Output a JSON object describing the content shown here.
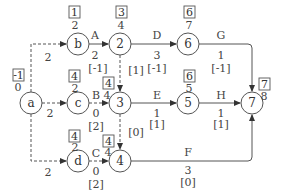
{
  "diagram": {
    "type": "activity-on-arrow network",
    "nodes": [
      {
        "id": "a",
        "label": "a",
        "box": "-1",
        "value": "0"
      },
      {
        "id": "b",
        "label": "b",
        "box": "1",
        "value": "2"
      },
      {
        "id": "c",
        "label": "c",
        "box": "4",
        "value": "2"
      },
      {
        "id": "d",
        "label": "d",
        "box": "4",
        "value": "2"
      },
      {
        "id": "n2",
        "label": "2",
        "box": "3",
        "value": "4"
      },
      {
        "id": "n3",
        "label": "3",
        "box": "4",
        "value": "4"
      },
      {
        "id": "n4",
        "label": "4",
        "box": "4",
        "value": "4"
      },
      {
        "id": "n5",
        "label": "5",
        "box": "6",
        "value": "5"
      },
      {
        "id": "n6",
        "label": "6",
        "box": "6",
        "value": "7"
      },
      {
        "id": "n7",
        "label": "7",
        "box": "7",
        "value": "8"
      }
    ],
    "edges": [
      {
        "from": "a",
        "to": "b",
        "style": "dashed",
        "duration": "2"
      },
      {
        "from": "a",
        "to": "c",
        "style": "dashed",
        "duration": "2"
      },
      {
        "from": "a",
        "to": "d",
        "style": "dashed",
        "duration": "2"
      },
      {
        "from": "b",
        "to": "n2",
        "style": "solid",
        "name": "A",
        "duration": "2",
        "float": "[-1]"
      },
      {
        "from": "c",
        "to": "n3",
        "style": "dashed",
        "name": "B",
        "duration": "0",
        "float": "[2]"
      },
      {
        "from": "d",
        "to": "n4",
        "style": "dashed",
        "name": "C",
        "duration": "0",
        "float": "[2]"
      },
      {
        "from": "n2",
        "to": "n6",
        "style": "solid",
        "name": "D",
        "duration": "3",
        "float": "[-1]"
      },
      {
        "from": "n2",
        "to": "n3",
        "style": "dashed",
        "float": "[1]"
      },
      {
        "from": "n3",
        "to": "n5",
        "style": "solid",
        "name": "E",
        "duration": "1",
        "float": "[1]"
      },
      {
        "from": "n3",
        "to": "n4",
        "style": "dashed",
        "float": "[0]"
      },
      {
        "from": "n6",
        "to": "n7",
        "style": "solid",
        "name": "G",
        "duration": "1",
        "float": "[-1]"
      },
      {
        "from": "n5",
        "to": "n7",
        "style": "solid",
        "name": "H",
        "duration": "1",
        "float": "[1]"
      },
      {
        "from": "n4",
        "to": "n7",
        "style": "solid",
        "name": "F",
        "duration": "3",
        "float": "[0]"
      }
    ]
  }
}
